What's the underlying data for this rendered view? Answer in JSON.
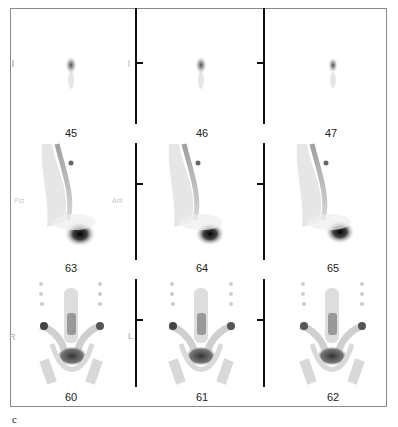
{
  "figure": {
    "panel_letter": "c",
    "rows": [
      {
        "name": "row-1",
        "frames": [
          {
            "label": "45"
          },
          {
            "label": "46"
          },
          {
            "label": "47"
          }
        ]
      },
      {
        "name": "row-2",
        "frames": [
          {
            "label": "63"
          },
          {
            "label": "64"
          },
          {
            "label": "65"
          }
        ],
        "side_labels": {
          "left": "Pst",
          "right": "Ant"
        }
      },
      {
        "name": "row-3",
        "frames": [
          {
            "label": "60"
          },
          {
            "label": "61"
          },
          {
            "label": "62"
          }
        ],
        "side_labels": {
          "left": "R",
          "right": "L"
        }
      }
    ]
  },
  "colors": {
    "frame_border": "#8a8a8a",
    "divider": "#111111",
    "uptake": "#1a1a1a"
  }
}
